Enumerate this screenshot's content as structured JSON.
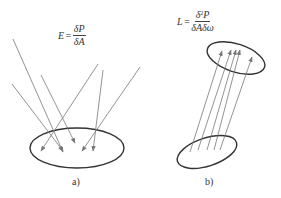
{
  "panels": [
    {
      "id": "a",
      "caption": "a)",
      "formula": {
        "lhs": "E",
        "equals": "=",
        "numerator": "δP",
        "denominator": "δA"
      },
      "description": "Irradiance: rays from many directions incident on a surface element"
    },
    {
      "id": "b",
      "caption": "b)",
      "formula": {
        "lhs": "L",
        "equals": "=",
        "numerator_base": "δ",
        "numerator_exp": "2",
        "numerator_rest": "P",
        "denominator": "δAδω"
      },
      "description": "Radiance: parallel rays within a solid angle passing from one surface element to another"
    }
  ],
  "style": {
    "stroke_color": "#777777",
    "ellipse_color": "#333333",
    "arrow_color": "#777777"
  }
}
